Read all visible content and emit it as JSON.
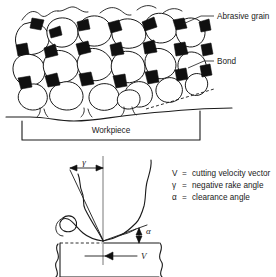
{
  "figure": {
    "background_color": "#ffffff",
    "line_color": "#1a1a1a",
    "bond_fill_color": "#101010",
    "grain_fill_color": "#ffffff"
  },
  "top_diagram": {
    "name": "grinding-wheel-surface",
    "labels": {
      "abrasive_grain": "Abrasive grain",
      "bond": "Bond",
      "workpiece": "Workpiece"
    }
  },
  "bottom_diagram": {
    "name": "single-grain-cutting-action",
    "symbols": {
      "gamma": "γ",
      "alpha": "α",
      "velocity": "V"
    },
    "legend": [
      {
        "symbol": "V",
        "equals": "=",
        "definition": "cutting velocity vector"
      },
      {
        "symbol": "γ",
        "equals": "=",
        "definition": "negative rake angle"
      },
      {
        "symbol": "α",
        "equals": "=",
        "definition": "clearance angle"
      }
    ]
  }
}
